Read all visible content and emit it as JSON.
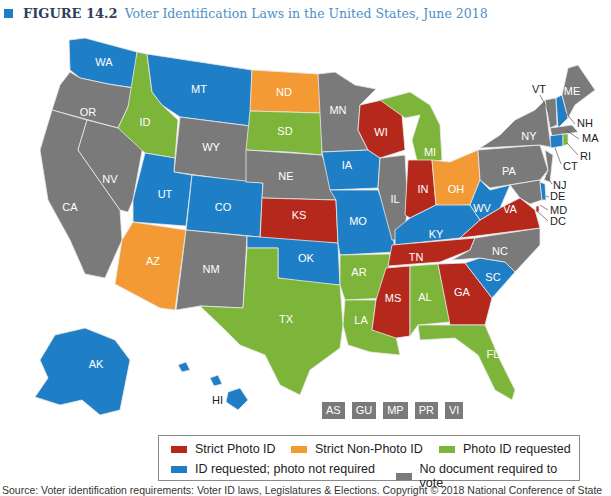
{
  "title": {
    "figure_label": "FIGURE 14.2",
    "caption": "Voter Identification Laws in the United States, June 2018"
  },
  "colors": {
    "strict_photo": "#b5291c",
    "strict_nonphoto": "#f39a34",
    "photo_requested": "#7db53a",
    "id_requested": "#1f7fc6",
    "no_document": "#7a7a7a",
    "title_accent": "#1f7fc6"
  },
  "legend": {
    "items": [
      {
        "label": "Strict Photo ID",
        "color": "#b5291c"
      },
      {
        "label": "Strict Non-Photo ID",
        "color": "#f39a34"
      },
      {
        "label": "Photo ID requested",
        "color": "#7db53a"
      },
      {
        "label": "ID requested; photo not required",
        "color": "#1f7fc6"
      },
      {
        "label": "No document required to vote",
        "color": "#7a7a7a"
      }
    ]
  },
  "territories": [
    "AS",
    "GU",
    "MP",
    "PR",
    "VI"
  ],
  "states": {
    "strict_photo": [
      "WI",
      "IN",
      "KS",
      "TN",
      "MS",
      "GA",
      "VA"
    ],
    "strict_nonphoto": [
      "ND",
      "AZ",
      "OH"
    ],
    "photo_requested": [
      "ID",
      "SD",
      "MI",
      "TX",
      "AR",
      "LA",
      "AL",
      "FL",
      "RI"
    ],
    "id_requested": [
      "WA",
      "MT",
      "UT",
      "CO",
      "IA",
      "MO",
      "OK",
      "KY",
      "WV",
      "SC",
      "NH",
      "CT",
      "DE",
      "AK",
      "HI"
    ],
    "no_document": [
      "OR",
      "CA",
      "NV",
      "WY",
      "NE",
      "NM",
      "MN",
      "IL",
      "NC",
      "NY",
      "PA",
      "VT",
      "ME",
      "MA",
      "NJ",
      "MD",
      "DC"
    ]
  },
  "labels": {
    "WA": "WA",
    "OR": "OR",
    "CA": "CA",
    "NV": "NV",
    "ID": "ID",
    "MT": "MT",
    "WY": "WY",
    "UT": "UT",
    "CO": "CO",
    "AZ": "AZ",
    "NM": "NM",
    "ND": "ND",
    "SD": "SD",
    "NE": "NE",
    "KS": "KS",
    "OK": "OK",
    "TX": "TX",
    "MN": "MN",
    "IA": "IA",
    "MO": "MO",
    "AR": "AR",
    "LA": "LA",
    "WI": "WI",
    "IL": "IL",
    "MI": "MI",
    "IN": "IN",
    "OH": "OH",
    "KY": "KY",
    "TN": "TN",
    "MS": "MS",
    "AL": "AL",
    "GA": "GA",
    "FL": "FL",
    "SC": "SC",
    "NC": "NC",
    "VA": "VA",
    "WV": "WV",
    "PA": "PA",
    "NY": "NY",
    "VT": "VT",
    "ME": "ME",
    "NH": "NH",
    "MA": "MA",
    "RI": "RI",
    "CT": "CT",
    "NJ": "NJ",
    "DE": "DE",
    "MD": "MD",
    "DC": "DC",
    "AK": "AK",
    "HI": "HI"
  },
  "source": "Source: Voter identification requirements: Voter ID laws, Legislatures & Elections. Copyright © 2018 National Conference of State"
}
